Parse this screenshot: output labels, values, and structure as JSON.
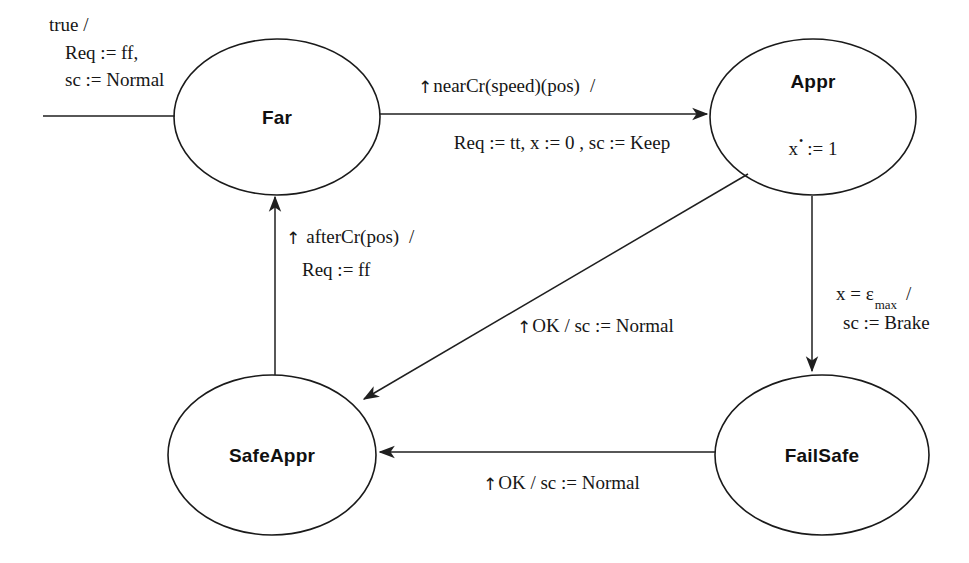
{
  "diagram": {
    "type": "state-machine",
    "title": "",
    "background_color": "#ffffff",
    "line_color": "#1f1f1f",
    "states": [
      {
        "id": "far",
        "label": "Far",
        "flow": "",
        "cx": 277,
        "cy": 117,
        "rx": 103,
        "ry": 78
      },
      {
        "id": "appr",
        "label": "Appr",
        "flow_prefix": "x",
        "flow_dot": "•",
        "flow_suffix": ":= 1",
        "cx": 813,
        "cy": 117,
        "rx": 103,
        "ry": 78
      },
      {
        "id": "safeappr",
        "label": "SafeAppr",
        "flow": "",
        "cx": 272,
        "cy": 455,
        "rx": 104,
        "ry": 80
      },
      {
        "id": "failsafe",
        "label": "FailSafe",
        "flow": "",
        "cx": 822,
        "cy": 455,
        "rx": 107,
        "ry": 80
      }
    ],
    "transitions": [
      {
        "id": "initial",
        "from": "",
        "to": "far",
        "guard": "true /",
        "action_line1": "Req := ff,",
        "action_line2": "sc := Normal",
        "has_arrowhead": false
      },
      {
        "id": "far-to-appr",
        "from": "far",
        "to": "appr",
        "event_arrow": "↑",
        "event": "nearCr(speed)(pos)",
        "slash": "/",
        "action": "Req := tt, x := 0 , sc := Keep",
        "has_arrowhead": true
      },
      {
        "id": "appr-to-failsafe",
        "from": "appr",
        "to": "failsafe",
        "guard_prefix": "x = ε",
        "guard_sub": "max",
        "slash": "/",
        "action": "sc := Brake",
        "has_arrowhead": true
      },
      {
        "id": "appr-to-safeappr",
        "from": "appr",
        "to": "safeappr",
        "event_arrow": "↑",
        "label": "OK  /  sc := Normal",
        "has_arrowhead": true
      },
      {
        "id": "failsafe-to-safeappr",
        "from": "failsafe",
        "to": "safeappr",
        "event_arrow": "↑",
        "label": "OK  /  sc := Normal",
        "has_arrowhead": true
      },
      {
        "id": "safeappr-to-far",
        "from": "safeappr",
        "to": "far",
        "event_arrow": "↑",
        "event": "afterCr(pos)",
        "slash": "/",
        "action": "Req := ff",
        "has_arrowhead": true
      }
    ]
  }
}
